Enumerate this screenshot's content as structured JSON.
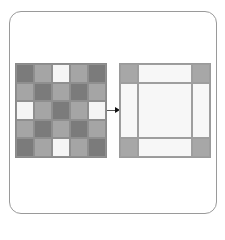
{
  "diagram": {
    "colors": {
      "dark": "#7b7b7b",
      "medium": "#a5a5a5",
      "white": "#f5f5f5",
      "right_corner": "#a7a7a7",
      "right_fill": "#f7f7f7",
      "frame_border": "#9a9a9a"
    },
    "left_grid": {
      "rows": 5,
      "cols": 5,
      "pattern": [
        [
          "dark",
          "medium",
          "white",
          "medium",
          "dark"
        ],
        [
          "medium",
          "dark",
          "medium",
          "dark",
          "medium"
        ],
        [
          "white",
          "medium",
          "dark",
          "medium",
          "white"
        ],
        [
          "medium",
          "dark",
          "medium",
          "dark",
          "medium"
        ],
        [
          "dark",
          "medium",
          "white",
          "medium",
          "dark"
        ]
      ]
    },
    "right_grid": {
      "rows": 3,
      "cols": 3,
      "pattern": [
        [
          "corner",
          "fill",
          "corner"
        ],
        [
          "fill",
          "fill",
          "fill"
        ],
        [
          "corner",
          "fill",
          "corner"
        ]
      ]
    },
    "arrow": {
      "direction": "right"
    }
  }
}
